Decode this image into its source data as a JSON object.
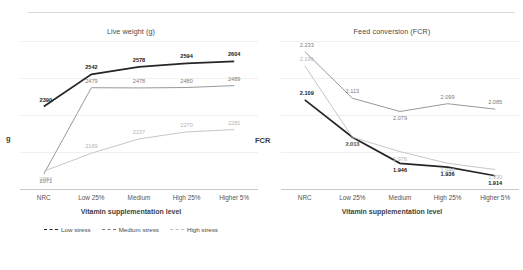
{
  "top_rule": true,
  "charts": [
    {
      "id": "live-weight",
      "title": "Live weight (g)",
      "ylabel": "g",
      "xlabel": "Vitamin supplementation level",
      "categories": [
        "NRC",
        "Low 25%",
        "Medium",
        "High 25%",
        "Higher 5%"
      ],
      "legend": [
        {
          "label": "Low stress",
          "color": "#262626"
        },
        {
          "label": "Medium stress",
          "color": "#7f7f7f"
        },
        {
          "label": "High stress",
          "color": "#bfbfbf"
        }
      ],
      "series": [
        {
          "name": "Low stress",
          "color": "#262626",
          "class": "dl-dark",
          "values": [
            2390,
            2542,
            2578,
            2594,
            2604
          ]
        },
        {
          "name": "Medium stress",
          "color": "#8c8c8c",
          "class": "dl-mid",
          "values": [
            2071,
            2479,
            2478,
            2480,
            2489
          ]
        },
        {
          "name": "High stress",
          "color": "#bfbfbf",
          "class": "dl-light",
          "values": [
            2084,
            2169,
            2237,
            2270,
            2281
          ]
        }
      ],
      "ylim": [
        2000,
        2700
      ]
    },
    {
      "id": "feed-conversion",
      "title": "Feed conversion (FCR)",
      "ylabel": "FCR",
      "xlabel": "Vitamin supplementation level",
      "categories": [
        "NRC",
        "Low 25%",
        "Medium",
        "High 25%",
        "Higher 5%"
      ],
      "legend": [],
      "series": [
        {
          "name": "Low stress",
          "color": "#262626",
          "class": "dl-dark",
          "values": [
            2.109,
            2.013,
            1.946,
            1.936,
            1.914
          ]
        },
        {
          "name": "Medium stress",
          "color": "#8c8c8c",
          "class": "dl-mid",
          "values": [
            2.233,
            2.113,
            2.079,
            2.099,
            2.085
          ]
        },
        {
          "name": "High stress",
          "color": "#bfbfbf",
          "class": "dl-light",
          "values": [
            2.196,
            2.013,
            1.976,
            1.946,
            1.93
          ]
        }
      ],
      "ylim": [
        1.88,
        2.26
      ]
    }
  ],
  "chart_data": [
    {
      "type": "line",
      "title": "Live weight (g)",
      "xlabel": "Vitamin supplementation level",
      "ylabel": "g",
      "categories": [
        "NRC",
        "Low 25%",
        "Medium",
        "High 25%",
        "Higher 5%"
      ],
      "series": [
        {
          "name": "Low stress",
          "values": [
            2390,
            2542,
            2578,
            2594,
            2604
          ]
        },
        {
          "name": "Medium stress",
          "values": [
            2071,
            2479,
            2478,
            2480,
            2489
          ]
        },
        {
          "name": "High stress",
          "values": [
            2084,
            2169,
            2237,
            2270,
            2281
          ]
        }
      ],
      "ylim": [
        2000,
        2700
      ],
      "grid": true,
      "legend_position": "bottom"
    },
    {
      "type": "line",
      "title": "Feed conversion (FCR)",
      "xlabel": "Vitamin supplementation level",
      "ylabel": "FCR",
      "categories": [
        "NRC",
        "Low 25%",
        "Medium",
        "High 25%",
        "Higher 5%"
      ],
      "series": [
        {
          "name": "Low stress",
          "values": [
            2.109,
            2.013,
            1.946,
            1.936,
            1.914
          ]
        },
        {
          "name": "Medium stress",
          "values": [
            2.233,
            2.113,
            2.079,
            2.099,
            2.085
          ]
        },
        {
          "name": "High stress",
          "values": [
            2.196,
            2.013,
            1.976,
            1.946,
            1.93
          ]
        }
      ],
      "ylim": [
        1.88,
        2.26
      ],
      "grid": true,
      "legend_position": "none"
    }
  ]
}
